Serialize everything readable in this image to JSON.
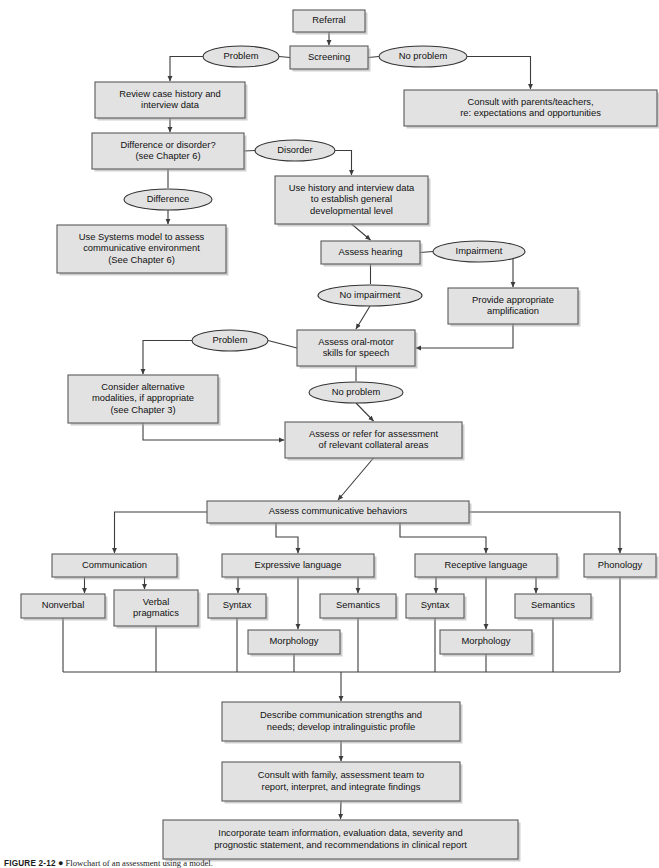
{
  "figure": {
    "caption_label": "FIGURE 2-12",
    "caption_bullet": "●",
    "caption_text": "Flowchart of an assessment using a model."
  },
  "style": {
    "box_fill": "#e2e2e2",
    "box_stroke": "#5a5a5a",
    "oval_fill": "#e2e2e2",
    "oval_stroke": "#333333",
    "edge_color": "#3c3c3c",
    "page_background": "#ffffff"
  },
  "chart_data": {
    "type": "diagram",
    "subtype": "flowchart",
    "title": "Flowchart of an assessment using a model.",
    "orientation": "top-to-bottom",
    "node_count": 29,
    "nodes": [
      {
        "id": "referral",
        "shape": "rect",
        "label": "Referral",
        "x": 293,
        "y": 10,
        "w": 72,
        "h": 22
      },
      {
        "id": "screening",
        "shape": "rect",
        "label": "Screening",
        "x": 290,
        "y": 46,
        "w": 78,
        "h": 23
      },
      {
        "id": "problem1",
        "shape": "oval",
        "label": "Problem",
        "x": 203,
        "y": 46,
        "w": 76,
        "h": 21
      },
      {
        "id": "noproblem1",
        "shape": "oval",
        "label": "No problem",
        "x": 379,
        "y": 46,
        "w": 88,
        "h": 21
      },
      {
        "id": "review_case_history",
        "shape": "rect",
        "label": "Review case history and\ninterview data",
        "x": 95,
        "y": 82,
        "w": 150,
        "h": 36
      },
      {
        "id": "consult_parents",
        "shape": "rect",
        "label": "Consult with parents/teachers,\nre: expectations and opportunities",
        "x": 404,
        "y": 90,
        "w": 253,
        "h": 36
      },
      {
        "id": "difference_disorder",
        "shape": "rect",
        "label": "Difference or disorder?\n(see Chapter 6)",
        "x": 92,
        "y": 133,
        "w": 152,
        "h": 36
      },
      {
        "id": "disorder",
        "shape": "oval",
        "label": "Disorder",
        "x": 255,
        "y": 140,
        "w": 80,
        "h": 21
      },
      {
        "id": "difference",
        "shape": "oval",
        "label": "Difference",
        "x": 124,
        "y": 189,
        "w": 88,
        "h": 21
      },
      {
        "id": "use_history",
        "shape": "rect",
        "label": "Use history and interview data\nto establish general\ndevelopmental level",
        "x": 275,
        "y": 176,
        "w": 153,
        "h": 48
      },
      {
        "id": "systems_model",
        "shape": "rect",
        "label": "Use Systems model to assess\ncommunicative environment\n(See Chapter 6)",
        "x": 57,
        "y": 225,
        "w": 169,
        "h": 48
      },
      {
        "id": "assess_hearing",
        "shape": "rect",
        "label": "Assess hearing",
        "x": 321,
        "y": 241,
        "w": 99,
        "h": 23
      },
      {
        "id": "impairment",
        "shape": "oval",
        "label": "Impairment",
        "x": 433,
        "y": 241,
        "w": 92,
        "h": 21
      },
      {
        "id": "no_impairment",
        "shape": "oval",
        "label": "No impairment",
        "x": 318,
        "y": 285,
        "w": 104,
        "h": 21
      },
      {
        "id": "provide_amp",
        "shape": "rect",
        "label": "Provide appropriate\namplification",
        "x": 448,
        "y": 288,
        "w": 130,
        "h": 36
      },
      {
        "id": "assess_oral_motor",
        "shape": "rect",
        "label": "Assess oral-motor\nskills for speech",
        "x": 297,
        "y": 330,
        "w": 118,
        "h": 36
      },
      {
        "id": "problem2",
        "shape": "oval",
        "label": "Problem",
        "x": 192,
        "y": 330,
        "w": 76,
        "h": 21
      },
      {
        "id": "no_problem2",
        "shape": "oval",
        "label": "No problem",
        "x": 309,
        "y": 382,
        "w": 94,
        "h": 21
      },
      {
        "id": "consider_alt",
        "shape": "rect",
        "label": "Consider alternative\nmodalities, if appropriate\n(see Chapter 3)",
        "x": 68,
        "y": 375,
        "w": 150,
        "h": 48
      },
      {
        "id": "assess_collateral",
        "shape": "rect",
        "label": "Assess or refer for assessment\nof relevant collateral areas",
        "x": 285,
        "y": 422,
        "w": 177,
        "h": 36
      },
      {
        "id": "assess_comm_behav",
        "shape": "rect",
        "label": "Assess communicative behaviors",
        "x": 207,
        "y": 501,
        "w": 262,
        "h": 22
      },
      {
        "id": "communication",
        "shape": "rect",
        "label": "Communication",
        "x": 52,
        "y": 554,
        "w": 125,
        "h": 23
      },
      {
        "id": "expressive_language",
        "shape": "rect",
        "label": "Expressive language",
        "x": 222,
        "y": 554,
        "w": 152,
        "h": 23
      },
      {
        "id": "receptive_language",
        "shape": "rect",
        "label": "Receptive language",
        "x": 415,
        "y": 554,
        "w": 142,
        "h": 23
      },
      {
        "id": "phonology",
        "shape": "rect",
        "label": "Phonology",
        "x": 584,
        "y": 554,
        "w": 72,
        "h": 23
      },
      {
        "id": "nonverbal",
        "shape": "rect",
        "label": "Nonverbal",
        "x": 21,
        "y": 594,
        "w": 84,
        "h": 24
      },
      {
        "id": "verbal_pragmatics",
        "shape": "rect",
        "label": "Verbal\npragmatics",
        "x": 114,
        "y": 590,
        "w": 84,
        "h": 36
      },
      {
        "id": "syntax_exp",
        "shape": "rect",
        "label": "Syntax",
        "x": 208,
        "y": 594,
        "w": 58,
        "h": 24
      },
      {
        "id": "semantics_exp",
        "shape": "rect",
        "label": "Semantics",
        "x": 320,
        "y": 594,
        "w": 76,
        "h": 24
      },
      {
        "id": "morphology_exp",
        "shape": "rect",
        "label": "Morphology",
        "x": 248,
        "y": 630,
        "w": 92,
        "h": 24
      },
      {
        "id": "syntax_rec",
        "shape": "rect",
        "label": "Syntax",
        "x": 406,
        "y": 594,
        "w": 58,
        "h": 24
      },
      {
        "id": "semantics_rec",
        "shape": "rect",
        "label": "Semantics",
        "x": 515,
        "y": 594,
        "w": 76,
        "h": 24
      },
      {
        "id": "morphology_rec",
        "shape": "rect",
        "label": "Morphology",
        "x": 440,
        "y": 630,
        "w": 92,
        "h": 24
      },
      {
        "id": "describe_comm",
        "shape": "rect",
        "label": "Describe communication strengths and\nneeds; develop intralinguistic profile",
        "x": 222,
        "y": 702,
        "w": 238,
        "h": 39
      },
      {
        "id": "consult_family",
        "shape": "rect",
        "label": "Consult with family, assessment team to\nreport, interpret, and integrate findings",
        "x": 222,
        "y": 762,
        "w": 238,
        "h": 39
      },
      {
        "id": "incorporate_team",
        "shape": "rect",
        "label": "Incorporate team information, evaluation data, severity and\nprognostic statement, and recommendations in clinical report",
        "x": 163,
        "y": 820,
        "w": 355,
        "h": 39
      }
    ],
    "edges": [
      {
        "from": "referral",
        "to": "screening",
        "label": ""
      },
      {
        "from": "screening",
        "to": "problem1",
        "label": "Problem"
      },
      {
        "from": "screening",
        "to": "noproblem1",
        "label": "No problem"
      },
      {
        "from": "problem1",
        "to": "review_case_history",
        "label": ""
      },
      {
        "from": "noproblem1",
        "to": "consult_parents",
        "label": ""
      },
      {
        "from": "review_case_history",
        "to": "difference_disorder",
        "label": ""
      },
      {
        "from": "difference_disorder",
        "to": "disorder",
        "label": "Disorder"
      },
      {
        "from": "difference_disorder",
        "to": "difference",
        "label": "Difference"
      },
      {
        "from": "disorder",
        "to": "use_history",
        "label": ""
      },
      {
        "from": "difference",
        "to": "systems_model",
        "label": ""
      },
      {
        "from": "use_history",
        "to": "assess_hearing",
        "label": ""
      },
      {
        "from": "assess_hearing",
        "to": "impairment",
        "label": "Impairment"
      },
      {
        "from": "assess_hearing",
        "to": "no_impairment",
        "label": "No impairment"
      },
      {
        "from": "impairment",
        "to": "provide_amp",
        "label": ""
      },
      {
        "from": "no_impairment",
        "to": "assess_oral_motor",
        "label": ""
      },
      {
        "from": "provide_amp",
        "to": "assess_oral_motor",
        "label": ""
      },
      {
        "from": "assess_oral_motor",
        "to": "problem2",
        "label": "Problem"
      },
      {
        "from": "assess_oral_motor",
        "to": "no_problem2",
        "label": "No problem"
      },
      {
        "from": "problem2",
        "to": "consider_alt",
        "label": ""
      },
      {
        "from": "no_problem2",
        "to": "assess_collateral",
        "label": ""
      },
      {
        "from": "consider_alt",
        "to": "assess_collateral",
        "label": ""
      },
      {
        "from": "assess_collateral",
        "to": "assess_comm_behav",
        "label": ""
      },
      {
        "from": "assess_comm_behav",
        "to": "communication",
        "label": ""
      },
      {
        "from": "assess_comm_behav",
        "to": "expressive_language",
        "label": ""
      },
      {
        "from": "assess_comm_behav",
        "to": "receptive_language",
        "label": ""
      },
      {
        "from": "assess_comm_behav",
        "to": "phonology",
        "label": ""
      },
      {
        "from": "communication",
        "to": "nonverbal",
        "label": ""
      },
      {
        "from": "communication",
        "to": "verbal_pragmatics",
        "label": ""
      },
      {
        "from": "expressive_language",
        "to": "syntax_exp",
        "label": ""
      },
      {
        "from": "expressive_language",
        "to": "morphology_exp",
        "label": ""
      },
      {
        "from": "expressive_language",
        "to": "semantics_exp",
        "label": ""
      },
      {
        "from": "receptive_language",
        "to": "syntax_rec",
        "label": ""
      },
      {
        "from": "receptive_language",
        "to": "morphology_rec",
        "label": ""
      },
      {
        "from": "receptive_language",
        "to": "semantics_rec",
        "label": ""
      },
      {
        "from": "nonverbal",
        "to": "describe_comm",
        "label": ""
      },
      {
        "from": "verbal_pragmatics",
        "to": "describe_comm",
        "label": ""
      },
      {
        "from": "syntax_exp",
        "to": "describe_comm",
        "label": ""
      },
      {
        "from": "morphology_exp",
        "to": "describe_comm",
        "label": ""
      },
      {
        "from": "semantics_exp",
        "to": "describe_comm",
        "label": ""
      },
      {
        "from": "syntax_rec",
        "to": "describe_comm",
        "label": ""
      },
      {
        "from": "morphology_rec",
        "to": "describe_comm",
        "label": ""
      },
      {
        "from": "semantics_rec",
        "to": "describe_comm",
        "label": ""
      },
      {
        "from": "phonology",
        "to": "describe_comm",
        "label": ""
      },
      {
        "from": "describe_comm",
        "to": "consult_family",
        "label": ""
      },
      {
        "from": "consult_family",
        "to": "incorporate_team",
        "label": ""
      }
    ]
  }
}
